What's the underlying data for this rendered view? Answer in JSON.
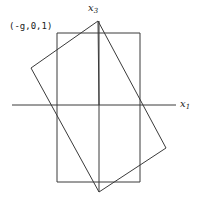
{
  "figure": {
    "title": "",
    "background_color": "#ffffff",
    "stroke_color": "#3a3a3a",
    "text_color": "#1a1a1a",
    "width": 201,
    "height": 203,
    "labels": {
      "point_label": "(-g,0,1)",
      "vertical_axis": "x",
      "vertical_axis_sub": "3",
      "horizontal_axis": "x",
      "horizontal_axis_sub": "1"
    }
  },
  "chart_data": {
    "type": "diagram",
    "title": "",
    "xlabel": "x1",
    "ylabel": "x3",
    "grid": false,
    "legend": null,
    "origin_px": [
      99,
      105
    ],
    "axes": [
      {
        "name": "horizontal-axis",
        "label": "x1",
        "from_px": [
          12,
          105
        ],
        "to_px": [
          176,
          105
        ]
      },
      {
        "name": "vertical-axis",
        "label": "x3",
        "from_px": [
          99,
          21
        ],
        "to_px": [
          99,
          192
        ]
      }
    ],
    "shapes": [
      {
        "name": "upright-rectangle",
        "type": "polygon",
        "closed": true,
        "points_px": [
          [
            57,
            33
          ],
          [
            140,
            33
          ],
          [
            140,
            182
          ],
          [
            57,
            182
          ]
        ]
      },
      {
        "name": "tilted-rectangle",
        "type": "polygon",
        "closed": true,
        "points_px": [
          [
            98,
            21
          ],
          [
            166,
            148
          ],
          [
            99,
            192
          ],
          [
            31,
            68
          ]
        ]
      },
      {
        "name": "apex-to-origin-diagonal",
        "type": "polyline",
        "closed": false,
        "points_px": [
          [
            98,
            21
          ],
          [
            99,
            105
          ]
        ]
      }
    ],
    "annotations": [
      {
        "name": "corner-point-label",
        "text": "(-g,0,1)",
        "anchor_px": [
          57,
          33
        ],
        "text_px": [
          9,
          28
        ]
      },
      {
        "name": "x3-axis-label",
        "text": "x3",
        "text_px": [
          88,
          8
        ]
      },
      {
        "name": "x1-axis-label",
        "text": "x1",
        "text_px": [
          180,
          104
        ]
      }
    ]
  }
}
